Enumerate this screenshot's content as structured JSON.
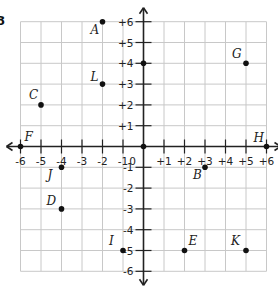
{
  "exercise_number": "8",
  "chart_data": {
    "type": "scatter",
    "title": "",
    "xlabel": "",
    "ylabel": "",
    "xlim": [
      -6,
      6
    ],
    "ylim": [
      -6,
      6
    ],
    "grid": true,
    "x_ticks": [
      "-6",
      "-5",
      "-4",
      "-3",
      "-2",
      "-1",
      "+1",
      "+2",
      "+3",
      "+4",
      "+5",
      "+6"
    ],
    "y_ticks": [
      "+6",
      "+5",
      "+4",
      "+3",
      "+2",
      "+1",
      "-1",
      "-2",
      "-3",
      "-4",
      "-5",
      "-6"
    ],
    "origin_label": "0",
    "points": [
      {
        "label": "A",
        "x": -2,
        "y": 6
      },
      {
        "label": "L",
        "x": -2,
        "y": 3
      },
      {
        "label": "C",
        "x": -5,
        "y": 2
      },
      {
        "label": "F",
        "x": -6,
        "y": 0
      },
      {
        "label": "G",
        "x": 5,
        "y": 4
      },
      {
        "label": "H",
        "x": 6,
        "y": 0
      },
      {
        "label": "",
        "x": 0,
        "y": 4
      },
      {
        "label": "",
        "x": 0,
        "y": 0
      },
      {
        "label": "J",
        "x": -4,
        "y": -1
      },
      {
        "label": "D",
        "x": -4,
        "y": -3
      },
      {
        "label": "I",
        "x": -1,
        "y": -5
      },
      {
        "label": "B",
        "x": 3,
        "y": -1
      },
      {
        "label": "E",
        "x": 2,
        "y": -5
      },
      {
        "label": "K",
        "x": 5,
        "y": -5
      }
    ]
  },
  "label_offsets": {
    "A": [
      -12,
      12
    ],
    "L": [
      -12,
      -3
    ],
    "C": [
      -12,
      -6
    ],
    "F": [
      4,
      -6
    ],
    "G": [
      -14,
      -5
    ],
    "H": [
      -13,
      -5
    ],
    "J": [
      -14,
      12
    ],
    "D": [
      -15,
      -4
    ],
    "I": [
      -14,
      -6
    ],
    "B": [
      -12,
      12
    ],
    "E": [
      4,
      -6
    ],
    "K": [
      -15,
      -6
    ]
  }
}
